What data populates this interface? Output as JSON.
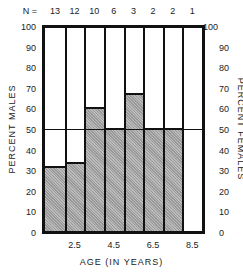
{
  "chart_data": {
    "type": "bar",
    "stacked": true,
    "title": "",
    "n_label": "N =",
    "n_values": [
      13,
      12,
      10,
      6,
      3,
      2,
      2,
      1
    ],
    "categories": [
      "1.5",
      "2.5",
      "3.5",
      "4.5",
      "5.5",
      "6.5",
      "7.5",
      "8.5"
    ],
    "x_tick_labels": [
      "2.5",
      "4.5",
      "6.5",
      "8.5"
    ],
    "series": [
      {
        "name": "Percent Males",
        "values": [
          31,
          33,
          60,
          50,
          67,
          50,
          50,
          0
        ],
        "color": "#aaaaaa"
      },
      {
        "name": "Percent Females",
        "values": [
          69,
          67,
          40,
          50,
          33,
          50,
          50,
          100
        ],
        "color": "#ffffff"
      }
    ],
    "xlabel": "AGE (IN YEARS)",
    "ylabel": "PERCENT MALES",
    "ylabel_right": "PERCENT FEMALES",
    "ylim": [
      0,
      100
    ],
    "y_ticks_left": [
      0,
      10,
      20,
      30,
      40,
      50,
      60,
      70,
      80,
      90,
      100
    ],
    "y_ticks_right": [
      100,
      90,
      80,
      70,
      60,
      50,
      40,
      30,
      20,
      10,
      0
    ],
    "reference_line": 50
  }
}
